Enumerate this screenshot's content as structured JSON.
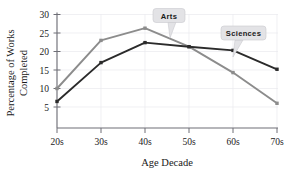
{
  "chart_data": {
    "type": "line",
    "title": "",
    "xlabel": "Age Decade",
    "ylabel": "Percentage of Works Completed",
    "ylabel_line1": "Percentage of Works",
    "ylabel_line2": "Completed",
    "categories": [
      "20s",
      "30s",
      "40s",
      "50s",
      "60s",
      "70s"
    ],
    "xtick_labels": [
      "20s",
      "30s",
      "40s",
      "50s",
      "60s",
      "70s"
    ],
    "ytick_labels": [
      "5",
      "10",
      "15",
      "20",
      "25",
      "30"
    ],
    "ytick_values": [
      5,
      10,
      15,
      20,
      25,
      30
    ],
    "ylim": [
      2.5,
      30
    ],
    "grid": true,
    "legend_position": "inline-callouts",
    "series": [
      {
        "name": "Arts",
        "color": "#8c8c8c",
        "values": [
          10.0,
          23.0,
          26.3,
          21.3,
          14.3,
          6.0
        ]
      },
      {
        "name": "Sciences",
        "color": "#2b2b2b",
        "values": [
          6.5,
          17.0,
          22.4,
          21.3,
          20.3,
          15.2
        ]
      }
    ],
    "annotations": [
      {
        "label": "Arts",
        "series": "Arts",
        "anchor_category": "50s"
      },
      {
        "label": "Sciences",
        "series": "Sciences",
        "anchor_category": "60s"
      }
    ]
  },
  "colors": {
    "arts_line": "#8c8c8c",
    "sciences_line": "#2b2b2b",
    "grid": "#e9e9ee",
    "axis": "#6e6e76",
    "callout_fill": "#e3e3e6",
    "text": "#1a1a1a",
    "background": "#ffffff"
  }
}
